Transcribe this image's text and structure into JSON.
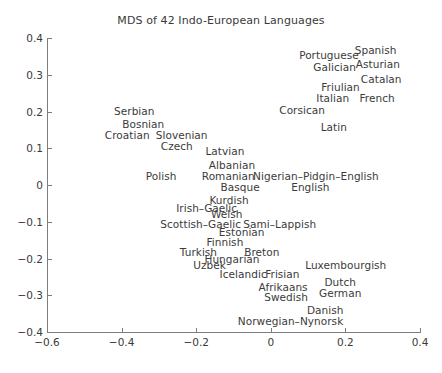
{
  "chart_data": {
    "type": "scatter",
    "title": "MDS of 42 Indo-European Languages",
    "xlabel": "",
    "ylabel": "",
    "xlim": [
      -0.6,
      0.4
    ],
    "ylim": [
      -0.4,
      0.4
    ],
    "xticks": [
      "-0.6",
      "-0.4",
      "-0.2",
      "0",
      "0.2",
      "0.4"
    ],
    "xtick_values": [
      -0.6,
      -0.4,
      -0.2,
      0,
      0.2,
      0.4
    ],
    "yticks": [
      "0.4",
      "0.3",
      "0.2",
      "0.1",
      "0",
      "-0.1",
      "-0.2",
      "-0.3",
      "-0.4"
    ],
    "ytick_values": [
      0.4,
      0.3,
      0.2,
      0.1,
      0,
      -0.1,
      -0.2,
      -0.3,
      -0.4
    ],
    "grid": false,
    "legend": null,
    "marker_style": "text-labels-only",
    "points": [
      {
        "label": "Portuguese",
        "x": 0.156,
        "y": 0.353
      },
      {
        "label": "Spanish",
        "x": 0.281,
        "y": 0.368
      },
      {
        "label": "Galician",
        "x": 0.171,
        "y": 0.32
      },
      {
        "label": "Asturian",
        "x": 0.287,
        "y": 0.329
      },
      {
        "label": "Catalan",
        "x": 0.296,
        "y": 0.288
      },
      {
        "label": "Friulian",
        "x": 0.187,
        "y": 0.266
      },
      {
        "label": "Italian",
        "x": 0.166,
        "y": 0.236
      },
      {
        "label": "French",
        "x": 0.285,
        "y": 0.236
      },
      {
        "label": "Corsican",
        "x": 0.084,
        "y": 0.204
      },
      {
        "label": "Latin",
        "x": 0.169,
        "y": 0.158
      },
      {
        "label": "Serbian",
        "x": -0.366,
        "y": 0.201
      },
      {
        "label": "Bosnian",
        "x": -0.342,
        "y": 0.166
      },
      {
        "label": "Croatian",
        "x": -0.385,
        "y": 0.136
      },
      {
        "label": "Slovenian",
        "x": -0.239,
        "y": 0.136
      },
      {
        "label": "Czech",
        "x": -0.252,
        "y": 0.106
      },
      {
        "label": "Latvian",
        "x": -0.123,
        "y": 0.092
      },
      {
        "label": "Albanian",
        "x": -0.104,
        "y": 0.054
      },
      {
        "label": "Polish",
        "x": -0.294,
        "y": 0.024
      },
      {
        "label": "Romanian",
        "x": -0.114,
        "y": 0.024
      },
      {
        "label": "Basque",
        "x": -0.082,
        "y": -0.006
      },
      {
        "label": "Nigerian-Pidgin-English",
        "x": 0.121,
        "y": 0.024
      },
      {
        "label": "English",
        "x": 0.106,
        "y": -0.006
      },
      {
        "label": "Kurdish",
        "x": -0.112,
        "y": -0.042
      },
      {
        "label": "Irish-Gaelic",
        "x": -0.172,
        "y": -0.063
      },
      {
        "label": "Welsh",
        "x": -0.118,
        "y": -0.079
      },
      {
        "label": "Scottish-Gaelic",
        "x": -0.188,
        "y": -0.106
      },
      {
        "label": "Sami-Lappish",
        "x": 0.024,
        "y": -0.106
      },
      {
        "label": "Estonian",
        "x": -0.078,
        "y": -0.128
      },
      {
        "label": "Finnish",
        "x": -0.123,
        "y": -0.155
      },
      {
        "label": "Turkish",
        "x": -0.194,
        "y": -0.182
      },
      {
        "label": "Breton",
        "x": -0.024,
        "y": -0.182
      },
      {
        "label": "Hungarian",
        "x": -0.104,
        "y": -0.201
      },
      {
        "label": "Uzbek",
        "x": -0.164,
        "y": -0.217
      },
      {
        "label": "Icelandic",
        "x": -0.074,
        "y": -0.241
      },
      {
        "label": "Frisian",
        "x": 0.031,
        "y": -0.241
      },
      {
        "label": "Luxembourgish",
        "x": 0.201,
        "y": -0.217
      },
      {
        "label": "Afrikaans",
        "x": 0.033,
        "y": -0.278
      },
      {
        "label": "Dutch",
        "x": 0.186,
        "y": -0.265
      },
      {
        "label": "Swedish",
        "x": 0.041,
        "y": -0.306
      },
      {
        "label": "German",
        "x": 0.186,
        "y": -0.295
      },
      {
        "label": "Danish",
        "x": 0.146,
        "y": -0.341
      },
      {
        "label": "Norwegian-Nynorsk",
        "x": 0.053,
        "y": -0.371
      }
    ]
  }
}
